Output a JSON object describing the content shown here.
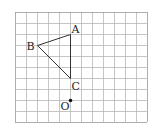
{
  "diagram": {
    "grid": {
      "origin_x": 15,
      "origin_y": 12,
      "cell": 11,
      "cols": 12,
      "rows": 10,
      "line_color": "#b8b8b8",
      "border_color": "#999999"
    },
    "points": {
      "A": {
        "label": "A",
        "col": 5,
        "row": 2
      },
      "B": {
        "label": "B",
        "col": 2,
        "row": 3
      },
      "C": {
        "label": "C",
        "col": 5,
        "row": 6
      },
      "O": {
        "label": "O",
        "col": 5,
        "row": 8
      }
    },
    "triangle": [
      "A",
      "B",
      "C"
    ],
    "line_color": "#333333"
  }
}
